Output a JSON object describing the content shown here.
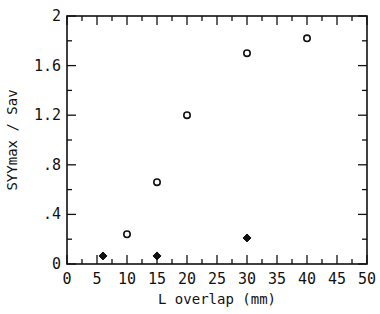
{
  "chart_data": {
    "type": "scatter",
    "title": "",
    "xlabel": "L overlap (mm)",
    "ylabel": "SYYmax / Sav",
    "xlim": [
      0,
      50
    ],
    "ylim": [
      0,
      2
    ],
    "x_ticks": [
      0,
      5,
      10,
      15,
      20,
      25,
      30,
      35,
      40,
      45,
      50
    ],
    "x_tick_labels": [
      "0",
      "5",
      "10",
      "15",
      "20",
      "25",
      "30",
      "35",
      "40",
      "45",
      "50"
    ],
    "x_minor_step": 2.5,
    "y_ticks": [
      0,
      0.4,
      0.8,
      1.2,
      1.6,
      2
    ],
    "y_tick_labels": [
      "0",
      ".4",
      ".8",
      "1.2",
      "1.6",
      "2"
    ],
    "y_minor_step": 0.2,
    "grid": false,
    "legend": null,
    "series": [
      {
        "name": "open circles",
        "marker": "open-circle",
        "x": [
          10,
          15,
          20,
          30,
          40
        ],
        "y": [
          0.24,
          0.66,
          1.2,
          1.7,
          1.82
        ]
      },
      {
        "name": "filled markers",
        "marker": "filled-diamond",
        "x": [
          6,
          15,
          30
        ],
        "y": [
          0.065,
          0.065,
          0.21
        ]
      }
    ],
    "frame": {
      "left": 67,
      "right": 367,
      "top": 16,
      "bottom": 264
    },
    "colors": {
      "ink": "#111111",
      "background": "#ffffff"
    }
  }
}
